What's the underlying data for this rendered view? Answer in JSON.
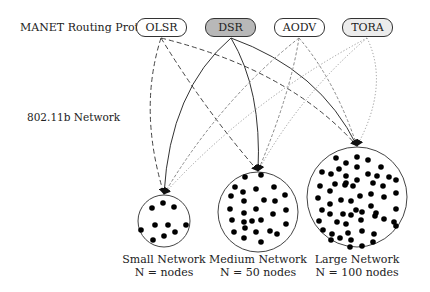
{
  "labels": {
    "protocol_row": "MANET Routing Protocol",
    "network_row": "802.11b Network"
  },
  "protocols": [
    {
      "id": "olsr",
      "label": "OLSR",
      "fill": "#ffffff",
      "x": 136,
      "style": "dashed",
      "color": "#444444",
      "dash": "5,3",
      "src": [
        161,
        38
      ]
    },
    {
      "id": "dsr",
      "label": "DSR",
      "fill": "#b8b8b8",
      "x": 205,
      "style": "solid",
      "color": "#333333",
      "dash": "",
      "src": [
        231,
        38
      ]
    },
    {
      "id": "aodv",
      "label": "AODV",
      "fill": "#ffffff",
      "x": 274,
      "style": "short-dashed",
      "color": "#888888",
      "dash": "3,2",
      "src": [
        299,
        38
      ]
    },
    {
      "id": "tora",
      "label": "TORA",
      "fill": "#ececec",
      "x": 342,
      "style": "dotted",
      "color": "#999999",
      "dash": "1.2,2",
      "src": [
        367,
        38
      ]
    }
  ],
  "networks": [
    {
      "id": "small",
      "name": "Small Network",
      "count": "N = nodes",
      "cx": 164,
      "cy": 221,
      "r": 26,
      "tip": [
        164,
        194
      ],
      "nodes": [
        [
          152,
          208
        ],
        [
          163,
          203
        ],
        [
          174,
          207
        ],
        [
          141,
          230
        ],
        [
          155,
          225
        ],
        [
          168,
          225
        ],
        [
          186,
          225
        ],
        [
          153,
          240
        ],
        [
          164,
          236
        ],
        [
          175,
          232
        ]
      ]
    },
    {
      "id": "medium",
      "name": "Medium Network",
      "count": "N = 50 nodes",
      "cx": 258,
      "cy": 212,
      "r": 40,
      "tip": [
        258,
        171
      ],
      "nodes": [
        [
          245,
          177
        ],
        [
          261,
          175
        ],
        [
          235,
          187
        ],
        [
          243,
          192
        ],
        [
          256,
          189
        ],
        [
          274,
          187
        ],
        [
          231,
          196
        ],
        [
          244,
          201
        ],
        [
          264,
          200
        ],
        [
          275,
          201
        ],
        [
          285,
          195
        ],
        [
          230,
          209
        ],
        [
          244,
          213
        ],
        [
          256,
          209
        ],
        [
          273,
          214
        ],
        [
          286,
          210
        ],
        [
          232,
          220
        ],
        [
          244,
          222
        ],
        [
          252,
          221
        ],
        [
          261,
          220
        ],
        [
          286,
          224
        ],
        [
          234,
          232
        ],
        [
          245,
          228
        ],
        [
          256,
          232
        ],
        [
          270,
          231
        ],
        [
          277,
          234
        ],
        [
          244,
          238
        ],
        [
          261,
          242
        ]
      ]
    },
    {
      "id": "large",
      "name": "Large Network",
      "count": "N = 100 nodes",
      "cx": 357,
      "cy": 197,
      "r": 50,
      "tip": [
        357,
        146
      ],
      "nodes": [
        [
          336,
          158
        ],
        [
          346,
          163
        ],
        [
          357,
          157
        ],
        [
          368,
          160
        ],
        [
          322,
          172
        ],
        [
          331,
          174
        ],
        [
          339,
          169
        ],
        [
          346,
          176
        ],
        [
          357,
          167
        ],
        [
          368,
          174
        ],
        [
          381,
          167
        ],
        [
          346,
          183
        ],
        [
          357,
          180
        ],
        [
          377,
          176
        ],
        [
          389,
          177
        ],
        [
          320,
          186
        ],
        [
          335,
          184
        ],
        [
          345,
          185
        ],
        [
          353,
          186
        ],
        [
          373,
          183
        ],
        [
          383,
          186
        ],
        [
          396,
          180
        ],
        [
          330,
          191
        ],
        [
          318,
          198
        ],
        [
          341,
          200
        ],
        [
          351,
          201
        ],
        [
          360,
          196
        ],
        [
          371,
          194
        ],
        [
          384,
          197
        ],
        [
          396,
          193
        ],
        [
          330,
          204
        ],
        [
          322,
          210
        ],
        [
          371,
          206
        ],
        [
          356,
          210
        ],
        [
          330,
          214
        ],
        [
          343,
          214
        ],
        [
          351,
          215
        ],
        [
          362,
          212
        ],
        [
          376,
          213
        ],
        [
          396,
          209
        ],
        [
          319,
          221
        ],
        [
          337,
          222
        ],
        [
          346,
          224
        ],
        [
          361,
          220
        ],
        [
          375,
          216
        ],
        [
          384,
          219
        ],
        [
          394,
          222
        ],
        [
          323,
          230
        ],
        [
          332,
          234
        ],
        [
          348,
          233
        ],
        [
          362,
          231
        ],
        [
          374,
          234
        ],
        [
          396,
          226
        ],
        [
          331,
          240
        ],
        [
          340,
          238
        ],
        [
          351,
          240
        ],
        [
          373,
          242
        ],
        [
          350,
          247
        ],
        [
          362,
          246
        ]
      ]
    }
  ],
  "connections": [
    {
      "from": "olsr",
      "to": "small",
      "ctrl": [
        138,
        110
      ]
    },
    {
      "from": "olsr",
      "to": "medium",
      "ctrl": [
        205,
        110
      ]
    },
    {
      "from": "olsr",
      "to": "large",
      "ctrl": [
        290,
        70
      ]
    },
    {
      "from": "dsr",
      "to": "small",
      "ctrl": [
        170,
        90
      ]
    },
    {
      "from": "dsr",
      "to": "medium",
      "ctrl": [
        262,
        90
      ]
    },
    {
      "from": "dsr",
      "to": "large",
      "ctrl": [
        320,
        70
      ]
    },
    {
      "from": "aodv",
      "to": "small",
      "ctrl": [
        220,
        100
      ]
    },
    {
      "from": "aodv",
      "to": "medium",
      "ctrl": [
        290,
        95
      ]
    },
    {
      "from": "aodv",
      "to": "large",
      "ctrl": [
        335,
        80
      ]
    },
    {
      "from": "tora",
      "to": "small",
      "ctrl": [
        250,
        100
      ]
    },
    {
      "from": "tora",
      "to": "medium",
      "ctrl": [
        300,
        95
      ]
    },
    {
      "from": "tora",
      "to": "large",
      "ctrl": [
        390,
        85
      ]
    }
  ]
}
